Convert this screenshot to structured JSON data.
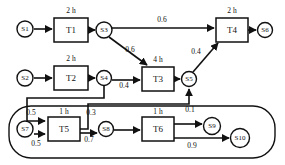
{
  "diagram": {
    "type": "workflow-petri-net",
    "places": [
      {
        "id": "S1",
        "label": "S1",
        "cx": 25,
        "cy": 29,
        "r": 8
      },
      {
        "id": "S2",
        "label": "S2",
        "cx": 25,
        "cy": 78,
        "r": 8
      },
      {
        "id": "S3",
        "label": "S3",
        "cx": 104,
        "cy": 30,
        "r": 8
      },
      {
        "id": "S4",
        "label": "S4",
        "cx": 104,
        "cy": 78,
        "r": 7.5
      },
      {
        "id": "S5",
        "label": "S5",
        "cx": 189,
        "cy": 79,
        "r": 7.5
      },
      {
        "id": "S6",
        "label": "S6",
        "cx": 265,
        "cy": 30,
        "r": 7.5
      },
      {
        "id": "S7",
        "label": "S7",
        "cx": 25,
        "cy": 129,
        "r": 8
      },
      {
        "id": "S8",
        "label": "S8",
        "cx": 106,
        "cy": 129,
        "r": 7.5
      },
      {
        "id": "S9",
        "label": "S9",
        "cx": 212,
        "cy": 126,
        "r": 8.5
      },
      {
        "id": "S10",
        "label": "S10",
        "cx": 240,
        "cy": 138,
        "r": 9.5
      }
    ],
    "transitions": [
      {
        "id": "T1",
        "label": "T1",
        "duration": "2 h",
        "x": 54,
        "y": 18,
        "w": 34,
        "h": 24
      },
      {
        "id": "T2",
        "label": "T2",
        "duration": "2 h",
        "x": 54,
        "y": 66,
        "w": 34,
        "h": 24
      },
      {
        "id": "T3",
        "label": "T3",
        "duration": "4 h",
        "x": 142,
        "y": 67,
        "w": 32,
        "h": 24
      },
      {
        "id": "T4",
        "label": "T4",
        "duration": "2 h",
        "x": 216,
        "y": 18,
        "w": 32,
        "h": 24
      },
      {
        "id": "T5",
        "label": "T5",
        "duration": "1 h",
        "x": 48,
        "y": 117,
        "w": 32,
        "h": 24
      },
      {
        "id": "T6",
        "label": "T6",
        "duration": "1 h",
        "x": 142,
        "y": 117,
        "w": 32,
        "h": 24
      }
    ],
    "arcs": [
      {
        "from": "S1",
        "to": "T1",
        "weight": ""
      },
      {
        "from": "T1",
        "to": "S3",
        "weight": ""
      },
      {
        "from": "S3",
        "to": "T4",
        "weight": "0.6"
      },
      {
        "from": "S3",
        "to": "T3",
        "weight": "0.6"
      },
      {
        "from": "S2",
        "to": "T2",
        "weight": ""
      },
      {
        "from": "T2",
        "to": "S4",
        "weight": ""
      },
      {
        "from": "S4",
        "to": "T3",
        "weight": "0.4"
      },
      {
        "from": "S4",
        "to": "T5",
        "weight": "0.5"
      },
      {
        "from": "T3",
        "to": "S5",
        "weight": ""
      },
      {
        "from": "S5",
        "to": "T4",
        "weight": "0.4"
      },
      {
        "from": "T4",
        "to": "S6",
        "weight": ""
      },
      {
        "from": "S7",
        "to": "T5",
        "weight": "0.5"
      },
      {
        "from": "T5",
        "to": "S8",
        "weight": "0.7"
      },
      {
        "from": "T5",
        "to": "S5",
        "weight": "0.3"
      },
      {
        "from": "S8",
        "to": "T6",
        "weight": ""
      },
      {
        "from": "T6",
        "to": "S9",
        "weight": "0.1"
      },
      {
        "from": "T6",
        "to": "S10",
        "weight": "0.9"
      }
    ],
    "weight_labels": [
      {
        "id": "w-s3-t4",
        "text": "0.6",
        "x": 162,
        "y": 22
      },
      {
        "id": "w-s3-t3",
        "text": "0.6",
        "x": 130,
        "y": 52
      },
      {
        "id": "w-s4-t3",
        "text": "0.4",
        "x": 124,
        "y": 88
      },
      {
        "id": "w-s5-t4",
        "text": "0.4",
        "x": 196,
        "y": 54
      },
      {
        "id": "w-s4-t5",
        "text": "0.5",
        "x": 31,
        "y": 115
      },
      {
        "id": "w-s7-t5",
        "text": "0.5",
        "x": 36,
        "y": 146
      },
      {
        "id": "w-t5-s5",
        "text": "0.3",
        "x": 91,
        "y": 115
      },
      {
        "id": "w-t5-s8",
        "text": "0.7",
        "x": 89,
        "y": 142
      },
      {
        "id": "w-t6-s9",
        "text": "0.1",
        "x": 190,
        "y": 112
      },
      {
        "id": "w-t6-s10",
        "text": "0.9",
        "x": 192,
        "y": 148
      }
    ],
    "loop_region": {
      "x": 9,
      "y": 106,
      "w": 266,
      "h": 52,
      "rx": 22
    },
    "colors": {
      "stroke": "#111111",
      "fill": "#ffffff",
      "background": "#ffffff"
    }
  }
}
